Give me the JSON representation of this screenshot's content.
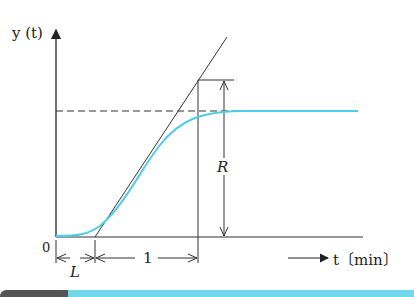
{
  "diagram": {
    "y_axis_label": "y (t)",
    "x_axis_label": "t〔min〕",
    "origin_label": "0",
    "dead_time_label": "L",
    "unit_interval_label": "1",
    "reaction_label": "R",
    "colors": {
      "response_curve": "#4dcde6",
      "lines": "#333333",
      "bottom_bar_dark": "#555555",
      "bottom_bar_accent": "#6fd8ea"
    }
  }
}
